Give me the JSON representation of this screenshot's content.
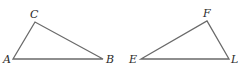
{
  "diagram": {
    "triangles": [
      {
        "name": "triangle-ABC",
        "vertices": [
          {
            "label": "A",
            "x": 13,
            "y": 59,
            "lx": 3,
            "ly": 63
          },
          {
            "label": "C",
            "x": 35,
            "y": 22,
            "lx": 30,
            "ly": 18
          },
          {
            "label": "B",
            "x": 103,
            "y": 59,
            "lx": 106,
            "ly": 63
          }
        ]
      },
      {
        "name": "triangle-EFL",
        "vertices": [
          {
            "label": "E",
            "x": 141,
            "y": 59,
            "lx": 129,
            "ly": 63
          },
          {
            "label": "F",
            "x": 207,
            "y": 21,
            "lx": 203,
            "ly": 17
          },
          {
            "label": "L",
            "x": 229,
            "y": 59,
            "lx": 231,
            "ly": 63
          }
        ]
      }
    ],
    "colors": {
      "edge": "#6a6a6a",
      "label": "#2a2a2a",
      "background": "#ffffff"
    }
  }
}
